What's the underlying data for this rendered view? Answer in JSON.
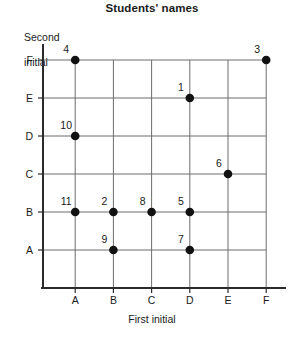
{
  "chart_data": {
    "type": "scatter",
    "title": "Students' names",
    "xlabel": "First initial",
    "ylabel": "Second\ninitial",
    "ylabel_line1": "Second",
    "ylabel_line2": "initial",
    "categories_x": [
      "A",
      "B",
      "C",
      "D",
      "E",
      "F"
    ],
    "categories_y": [
      "A",
      "B",
      "C",
      "D",
      "E",
      "F"
    ],
    "grid": true,
    "legend": "none",
    "points": [
      {
        "label": "4",
        "x": "A",
        "y": "F"
      },
      {
        "label": "3",
        "x": "F",
        "y": "F"
      },
      {
        "label": "1",
        "x": "D",
        "y": "E"
      },
      {
        "label": "10",
        "x": "A",
        "y": "D"
      },
      {
        "label": "6",
        "x": "E",
        "y": "C"
      },
      {
        "label": "11",
        "x": "A",
        "y": "B"
      },
      {
        "label": "2",
        "x": "B",
        "y": "B"
      },
      {
        "label": "8",
        "x": "C",
        "y": "B"
      },
      {
        "label": "5",
        "x": "D",
        "y": "B"
      },
      {
        "label": "9",
        "x": "B",
        "y": "A"
      },
      {
        "label": "7",
        "x": "D",
        "y": "A"
      }
    ],
    "colors": {
      "point": "#111111",
      "axis": "#2b2b2b",
      "grid": "#6d6d6d",
      "text": "#1a1a1a",
      "background": "#ffffff"
    }
  }
}
